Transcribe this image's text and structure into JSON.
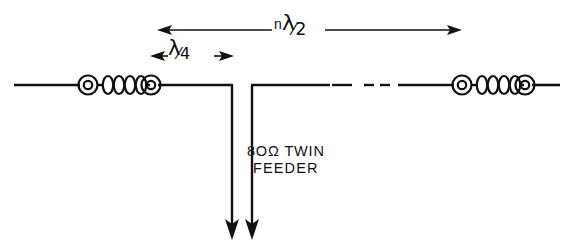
{
  "figure": {
    "background_color": "#ffffff",
    "ink_color": "#111111",
    "width": 569,
    "height": 246
  },
  "dimensions": {
    "total_length": {
      "label_prefix": "n",
      "label_symbol": "λ",
      "label_fraction": "⁄2",
      "full_text": "n λ/2",
      "arrow_left_x": 157,
      "arrow_right_x": 462,
      "y": 30
    },
    "quarter_wave": {
      "label_symbol": "λ",
      "label_fraction": "⁄4",
      "full_text": "λ/4",
      "arrow_left_x": 152,
      "arrow_right_x": 232,
      "y": 56
    }
  },
  "feeder": {
    "caption_line1": "8OΩ TWIN",
    "caption_line2": "FEEDER",
    "impedance": "80Ω",
    "type": "TWIN FEEDER",
    "left_line_x": 232,
    "right_line_x": 252,
    "top_y": 85,
    "bottom_y": 238
  },
  "antenna": {
    "wire_y": 85,
    "left_end_x": 14,
    "right_end_x": 560,
    "break_dashes": [
      {
        "x1": 332,
        "x2": 352
      },
      {
        "x1": 364,
        "x2": 374
      },
      {
        "x1": 380,
        "x2": 390
      }
    ],
    "insulators": [
      {
        "name": "left-insulator",
        "x_start": 78,
        "x_end": 160,
        "disc_count": 4
      },
      {
        "name": "right-insulator",
        "x_start": 452,
        "x_end": 534,
        "disc_count": 4
      }
    ]
  }
}
